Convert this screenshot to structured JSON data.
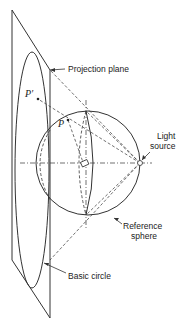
{
  "figure": {
    "type": "stereographic projection diagram",
    "labels": {
      "projection_plane": "Projection plane",
      "light_source_line1": "Light",
      "light_source_line2": "source",
      "reference_sphere_line1": "Reference",
      "reference_sphere_line2": "sphere",
      "basic_circle": "Basic circle",
      "point_p": "P",
      "point_p_prime": "P′"
    },
    "colors": {
      "line": "#333333",
      "background": "#ffffff"
    }
  }
}
